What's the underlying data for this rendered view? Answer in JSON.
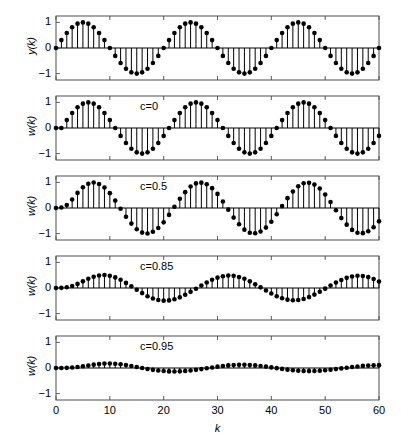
{
  "figure": {
    "title": "",
    "width": 401,
    "height": 430,
    "background": "#ffffff",
    "line_color": "#000000",
    "marker_color": "#000000",
    "axis_color": "#4d4d4d"
  },
  "axes": {
    "x": {
      "label": "k",
      "ticks": [
        0,
        10,
        20,
        30,
        40,
        50,
        60
      ],
      "tick_labels": [
        "0",
        "10",
        "20",
        "30",
        "40",
        "50",
        "60"
      ],
      "range": [
        0,
        60
      ]
    },
    "y": {
      "ticks": [
        1,
        0,
        -1
      ],
      "tick_labels": [
        "1",
        "0",
        "−1"
      ],
      "range": [
        -1.25,
        1.25
      ]
    }
  },
  "chart_data": {
    "type": "line",
    "title": "",
    "xlabel": "k",
    "ylabel": "amplitude",
    "xlim": [
      0,
      60
    ],
    "ylim": [
      -1.25,
      1.25
    ],
    "grid": false,
    "legend": "none",
    "plot_style": "stem",
    "panels": [
      {
        "index": 0,
        "ylabel": "y(k)",
        "annotation": "",
        "annotation_c": null,
        "description": "Reference sinusoid, unity amplitude, period 20 samples",
        "amplitude": 1.0,
        "period": 20,
        "phase": 0.0,
        "x": [
          0,
          1,
          2,
          3,
          4,
          5,
          6,
          7,
          8,
          9,
          10,
          11,
          12,
          13,
          14,
          15,
          16,
          17,
          18,
          19,
          20,
          21,
          22,
          23,
          24,
          25,
          26,
          27,
          28,
          29,
          30,
          31,
          32,
          33,
          34,
          35,
          36,
          37,
          38,
          39,
          40,
          41,
          42,
          43,
          44,
          45,
          46,
          47,
          48,
          49,
          50,
          51,
          52,
          53,
          54,
          55,
          56,
          57,
          58,
          59,
          60
        ],
        "y": [
          0.0,
          0.309,
          0.588,
          0.809,
          0.951,
          1.0,
          0.951,
          0.809,
          0.588,
          0.309,
          0.0,
          -0.309,
          -0.588,
          -0.809,
          -0.951,
          -1.0,
          -0.951,
          -0.809,
          -0.588,
          -0.309,
          0.0,
          0.309,
          0.588,
          0.809,
          0.951,
          1.0,
          0.951,
          0.809,
          0.588,
          0.309,
          0.0,
          -0.309,
          -0.588,
          -0.809,
          -0.951,
          -1.0,
          -0.951,
          -0.809,
          -0.588,
          -0.309,
          0.0,
          0.309,
          0.588,
          0.809,
          0.951,
          1.0,
          0.951,
          0.809,
          0.588,
          0.309,
          0.0,
          -0.309,
          -0.588,
          -0.809,
          -0.951,
          -1.0,
          -0.951,
          -0.809,
          -0.588,
          -0.309,
          0.0
        ]
      },
      {
        "index": 1,
        "ylabel": "w(k)",
        "annotation": "c=0",
        "annotation_c": "0",
        "description": "Filter output with c=0; identical to input, amplitude 1.0",
        "amplitude": 1.0,
        "period": 20,
        "phase": 0.0,
        "x": [
          0,
          1,
          2,
          3,
          4,
          5,
          6,
          7,
          8,
          9,
          10,
          11,
          12,
          13,
          14,
          15,
          16,
          17,
          18,
          19,
          20,
          21,
          22,
          23,
          24,
          25,
          26,
          27,
          28,
          29,
          30,
          31,
          32,
          33,
          34,
          35,
          36,
          37,
          38,
          39,
          40,
          41,
          42,
          43,
          44,
          45,
          46,
          47,
          48,
          49,
          50,
          51,
          52,
          53,
          54,
          55,
          56,
          57,
          58,
          59,
          60
        ],
        "y": [
          0.0,
          0.0,
          0.309,
          0.588,
          0.809,
          0.951,
          1.0,
          0.951,
          0.809,
          0.588,
          0.309,
          0.0,
          -0.309,
          -0.588,
          -0.809,
          -0.951,
          -1.0,
          -0.951,
          -0.809,
          -0.588,
          -0.309,
          0.0,
          0.309,
          0.588,
          0.809,
          0.951,
          1.0,
          0.951,
          0.809,
          0.588,
          0.309,
          0.0,
          -0.309,
          -0.588,
          -0.809,
          -0.951,
          -1.0,
          -0.951,
          -0.809,
          -0.588,
          -0.309,
          0.0,
          0.309,
          0.588,
          0.809,
          0.951,
          1.0,
          0.951,
          0.809,
          0.588,
          0.309,
          0.0,
          -0.309,
          -0.588,
          -0.809,
          -0.951,
          -1.0,
          -0.951,
          -0.809,
          -0.588,
          -0.309
        ]
      },
      {
        "index": 2,
        "ylabel": "w(k)",
        "annotation": "c=0.5",
        "annotation_c": "0.5",
        "description": "Filter output with c=0.5; near-unity amplitude with slight lag",
        "amplitude": 0.97,
        "period": 20,
        "phase": -0.35,
        "x": [
          0,
          1,
          2,
          3,
          4,
          5,
          6,
          7,
          8,
          9,
          10,
          11,
          12,
          13,
          14,
          15,
          16,
          17,
          18,
          19,
          20,
          21,
          22,
          23,
          24,
          25,
          26,
          27,
          28,
          29,
          30,
          31,
          32,
          33,
          34,
          35,
          36,
          37,
          38,
          39,
          40,
          41,
          42,
          43,
          44,
          45,
          46,
          47,
          48,
          49,
          50,
          51,
          52,
          53,
          54,
          55,
          56,
          57,
          58,
          59,
          60
        ],
        "y": [
          0.0,
          0.02,
          0.12,
          0.33,
          0.59,
          0.81,
          0.95,
          0.995,
          0.94,
          0.8,
          0.58,
          0.29,
          -0.03,
          -0.34,
          -0.61,
          -0.83,
          -0.96,
          -0.995,
          -0.93,
          -0.78,
          -0.56,
          -0.27,
          0.05,
          0.36,
          0.62,
          0.84,
          0.96,
          0.99,
          0.925,
          0.775,
          0.55,
          0.255,
          -0.065,
          -0.375,
          -0.635,
          -0.845,
          -0.965,
          -0.985,
          -0.92,
          -0.765,
          -0.54,
          -0.245,
          0.075,
          0.385,
          0.645,
          0.85,
          0.965,
          0.985,
          0.915,
          0.76,
          0.53,
          0.235,
          -0.085,
          -0.395,
          -0.65,
          -0.855,
          -0.965,
          -0.982,
          -0.91,
          -0.752,
          -0.522
        ]
      },
      {
        "index": 3,
        "ylabel": "w(k)",
        "annotation": "c=0.85",
        "annotation_c": "0.85",
        "description": "Filter output with c=0.85; attenuated to roughly half amplitude with visible phase lag",
        "amplitude": 0.5,
        "period": 20,
        "phase": -0.9,
        "x": [
          0,
          1,
          2,
          3,
          4,
          5,
          6,
          7,
          8,
          9,
          10,
          11,
          12,
          13,
          14,
          15,
          16,
          17,
          18,
          19,
          20,
          21,
          22,
          23,
          24,
          25,
          26,
          27,
          28,
          29,
          30,
          31,
          32,
          33,
          34,
          35,
          36,
          37,
          38,
          39,
          40,
          41,
          42,
          43,
          44,
          45,
          46,
          47,
          48,
          49,
          50,
          51,
          52,
          53,
          54,
          55,
          56,
          57,
          58,
          59,
          60
        ],
        "y": [
          0.0,
          0.005,
          0.03,
          0.08,
          0.16,
          0.26,
          0.36,
          0.44,
          0.49,
          0.505,
          0.48,
          0.415,
          0.32,
          0.2,
          0.07,
          -0.07,
          -0.2,
          -0.32,
          -0.41,
          -0.47,
          -0.495,
          -0.485,
          -0.44,
          -0.365,
          -0.265,
          -0.15,
          -0.03,
          0.095,
          0.215,
          0.32,
          0.405,
          0.46,
          0.485,
          0.475,
          0.43,
          0.36,
          0.26,
          0.145,
          0.025,
          -0.1,
          -0.215,
          -0.32,
          -0.4,
          -0.455,
          -0.48,
          -0.47,
          -0.428,
          -0.356,
          -0.258,
          -0.144,
          -0.025,
          0.098,
          0.212,
          0.315,
          0.397,
          0.452,
          0.477,
          0.468,
          0.425,
          0.354,
          0.256
        ]
      },
      {
        "index": 4,
        "ylabel": "w(k)",
        "annotation": "c=0.95",
        "annotation_c": "0.95",
        "description": "Filter output with c=0.95; heavily attenuated, amplitude about 0.17",
        "amplitude": 0.17,
        "period": 20,
        "phase": -1.2,
        "x": [
          0,
          1,
          2,
          3,
          4,
          5,
          6,
          7,
          8,
          9,
          10,
          11,
          12,
          13,
          14,
          15,
          16,
          17,
          18,
          19,
          20,
          21,
          22,
          23,
          24,
          25,
          26,
          27,
          28,
          29,
          30,
          31,
          32,
          33,
          34,
          35,
          36,
          37,
          38,
          39,
          40,
          41,
          42,
          43,
          44,
          45,
          46,
          47,
          48,
          49,
          50,
          51,
          52,
          53,
          54,
          55,
          56,
          57,
          58,
          59,
          60
        ],
        "y": [
          0.0,
          0.001,
          0.006,
          0.018,
          0.038,
          0.066,
          0.098,
          0.13,
          0.156,
          0.172,
          0.175,
          0.166,
          0.146,
          0.116,
          0.08,
          0.04,
          0.0,
          -0.038,
          -0.072,
          -0.1,
          -0.12,
          -0.132,
          -0.136,
          -0.131,
          -0.118,
          -0.098,
          -0.072,
          -0.042,
          -0.01,
          0.022,
          0.052,
          0.08,
          0.102,
          0.118,
          0.126,
          0.126,
          0.118,
          0.102,
          0.08,
          0.054,
          0.024,
          -0.006,
          -0.036,
          -0.064,
          -0.088,
          -0.106,
          -0.118,
          -0.122,
          -0.118,
          -0.107,
          -0.09,
          -0.068,
          -0.043,
          -0.016,
          0.011,
          0.037,
          0.061,
          0.082,
          0.098,
          0.108,
          0.112
        ]
      }
    ]
  }
}
